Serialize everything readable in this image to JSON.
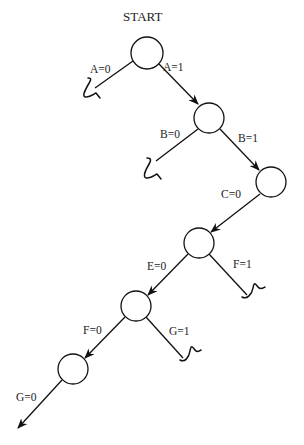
{
  "diagram": {
    "title": "START",
    "nodes": [
      {
        "id": "n1",
        "cx": 147,
        "cy": 53,
        "r": 16
      },
      {
        "id": "n2",
        "cx": 209,
        "cy": 118,
        "r": 15
      },
      {
        "id": "n3",
        "cx": 271,
        "cy": 182,
        "r": 15
      },
      {
        "id": "n4",
        "cx": 199,
        "cy": 243,
        "r": 15
      },
      {
        "id": "n5",
        "cx": 136,
        "cy": 306,
        "r": 15
      },
      {
        "id": "n6",
        "cx": 73,
        "cy": 369,
        "r": 15
      }
    ],
    "edges": [
      {
        "from": "n1",
        "to": "n2",
        "label": "A=1"
      },
      {
        "from": "n1",
        "to": "dead",
        "label": "A=0"
      },
      {
        "from": "n2",
        "to": "n3",
        "label": "B=1"
      },
      {
        "from": "n2",
        "to": "dead",
        "label": "B=0"
      },
      {
        "from": "n3",
        "to": "n4",
        "label": "C=0"
      },
      {
        "from": "n4",
        "to": "n5",
        "label": "E=0"
      },
      {
        "from": "n4",
        "to": "dead",
        "label": "F=1"
      },
      {
        "from": "n5",
        "to": "n6",
        "label": "F=0"
      },
      {
        "from": "n5",
        "to": "dead",
        "label": "G=1"
      },
      {
        "from": "n6",
        "to": "continue",
        "label": "G=0"
      }
    ],
    "labels": {
      "a0": "A=0",
      "a1": "A=1",
      "b0": "B=0",
      "b1": "B=1",
      "c0": "C=0",
      "e0": "E=0",
      "f1": "F=1",
      "f0": "F=0",
      "g1": "G=1",
      "g0": "G=0"
    }
  }
}
